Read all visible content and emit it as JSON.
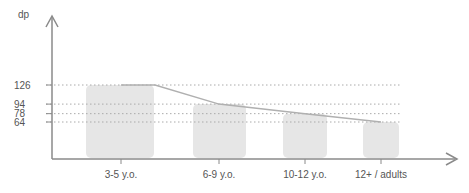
{
  "chart_data": {
    "type": "bar",
    "title": "",
    "xlabel": "",
    "ylabel": "dp",
    "categories": [
      "3-5 y.o.",
      "6-9 y.o.",
      "10-12 y.o.",
      "12+ / adults"
    ],
    "values": [
      126,
      94,
      78,
      64
    ],
    "y_ticks": [
      "126",
      "94",
      "78",
      "64"
    ],
    "reference_lines": "dotted horizontal at each value",
    "trend_line": "connects bar tops",
    "grid": false,
    "legend": null
  },
  "colors": {
    "bar": "#e6e6e6",
    "axis": "#8a8a8a",
    "dotted": "#aaaaaa",
    "trend": "#b0b0b0",
    "text": "#555555"
  }
}
